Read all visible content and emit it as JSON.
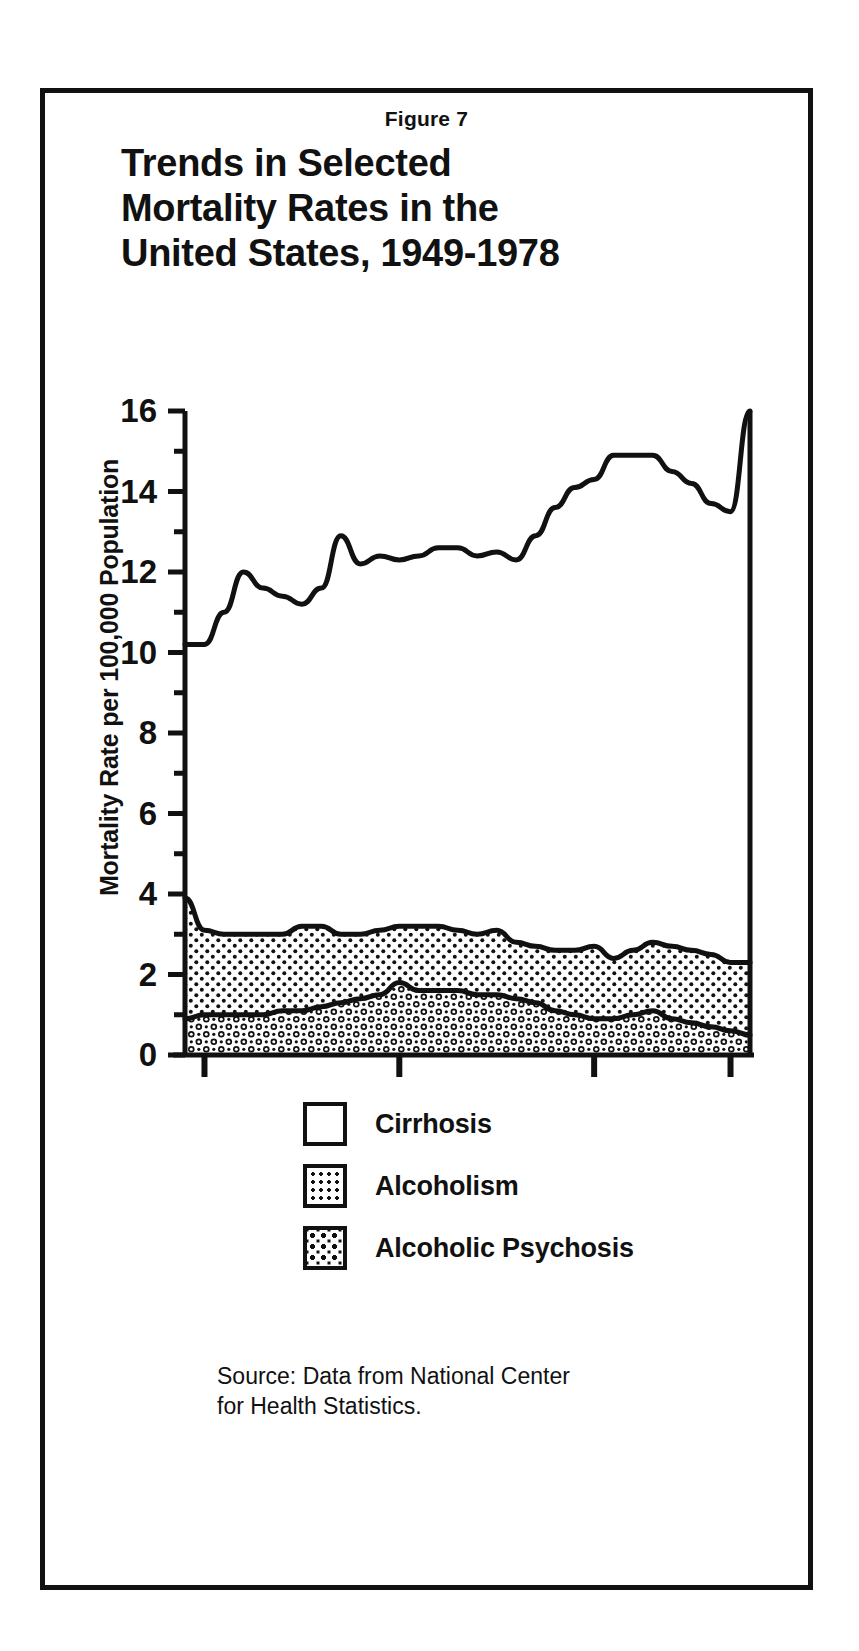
{
  "figure": {
    "number_label": "Figure 7",
    "title_line_1": "Trends in Selected",
    "title_line_2": "Mortality Rates in the",
    "title_line_3": "United States, 1949-1978"
  },
  "source": {
    "line_1": "Source: Data from National Center",
    "line_2": "for Health Statistics."
  },
  "legend": {
    "items": [
      {
        "label": "Cirrhosis",
        "pattern": "solid-white",
        "swatch_icon": "white-square-icon"
      },
      {
        "label": "Alcoholism",
        "pattern": "dots",
        "swatch_icon": "dotted-square-icon"
      },
      {
        "label": "Alcoholic Psychosis",
        "pattern": "mesh",
        "swatch_icon": "mesh-square-icon"
      }
    ]
  },
  "colors": {
    "ink": "#111111",
    "paper": "#ffffff"
  },
  "chart_data": {
    "type": "area",
    "stacked": true,
    "title": "Trends in Selected Mortality Rates in the United States, 1949-1978",
    "xlabel": "",
    "ylabel": "Mortality Rate per 100,000 Population",
    "xlim": [
      1949,
      1978
    ],
    "ylim": [
      0,
      16
    ],
    "grid": false,
    "legend_position": "below",
    "y_major_ticks": [
      0,
      2,
      4,
      6,
      8,
      10,
      12,
      14,
      16
    ],
    "y_minor_ticks": [
      1,
      3,
      5,
      7,
      9,
      11,
      13,
      15
    ],
    "y_tick_labels": [
      "0",
      "2",
      "4",
      "6",
      "8",
      "10",
      "12",
      "14",
      "16"
    ],
    "x_tick_values": [
      1950,
      1960,
      1970,
      1977
    ],
    "x_tick_labels": [
      "1950",
      "1960",
      "1970",
      "1977"
    ],
    "x": [
      1949,
      1950,
      1951,
      1952,
      1953,
      1954,
      1955,
      1956,
      1957,
      1958,
      1959,
      1960,
      1961,
      1962,
      1963,
      1964,
      1965,
      1966,
      1967,
      1968,
      1969,
      1970,
      1971,
      1972,
      1973,
      1974,
      1975,
      1976,
      1977,
      1978
    ],
    "series": [
      {
        "name": "Alcoholic Psychosis",
        "order": 1,
        "pattern": "mesh",
        "values": [
          0.9,
          1.0,
          1.0,
          1.0,
          1.0,
          1.1,
          1.1,
          1.2,
          1.3,
          1.4,
          1.5,
          1.8,
          1.6,
          1.6,
          1.6,
          1.5,
          1.5,
          1.4,
          1.3,
          1.1,
          1.0,
          0.9,
          0.9,
          1.0,
          1.1,
          0.9,
          0.8,
          0.7,
          0.6,
          0.5
        ]
      },
      {
        "name": "Alcoholism",
        "order": 2,
        "pattern": "dots",
        "values": [
          3.0,
          2.1,
          2.0,
          2.0,
          2.0,
          1.9,
          2.1,
          2.0,
          1.7,
          1.6,
          1.6,
          1.4,
          1.6,
          1.6,
          1.5,
          1.5,
          1.6,
          1.4,
          1.4,
          1.5,
          1.6,
          1.8,
          1.5,
          1.6,
          1.7,
          1.8,
          1.8,
          1.8,
          1.7,
          1.8
        ]
      },
      {
        "name": "Cirrhosis",
        "order": 3,
        "pattern": "solid-white",
        "values": [
          6.3,
          7.1,
          8.0,
          9.0,
          8.6,
          8.4,
          8.1,
          8.4,
          9.9,
          9.2,
          9.3,
          9.1,
          9.2,
          9.4,
          9.5,
          9.4,
          9.4,
          9.5,
          10.2,
          11.0,
          11.5,
          11.6,
          12.5,
          12.3,
          12.1,
          11.8,
          11.6,
          11.2,
          11.2,
          13.7
        ]
      }
    ],
    "cumulative_top_boundaries": {
      "alcoholic_psychosis_top": [
        0.9,
        1.0,
        1.0,
        1.0,
        1.0,
        1.1,
        1.1,
        1.2,
        1.3,
        1.4,
        1.5,
        1.8,
        1.6,
        1.6,
        1.6,
        1.5,
        1.5,
        1.4,
        1.3,
        1.1,
        1.0,
        0.9,
        0.9,
        1.0,
        1.1,
        0.9,
        0.8,
        0.7,
        0.6,
        0.5
      ],
      "alcoholism_top": [
        3.9,
        3.1,
        3.0,
        3.0,
        3.0,
        3.0,
        3.2,
        3.2,
        3.0,
        3.0,
        3.1,
        3.2,
        3.2,
        3.2,
        3.1,
        3.0,
        3.1,
        2.8,
        2.7,
        2.6,
        2.6,
        2.7,
        2.4,
        2.6,
        2.8,
        2.7,
        2.6,
        2.5,
        2.3,
        2.3
      ],
      "cirrhosis_top": [
        10.2,
        10.2,
        11.0,
        12.0,
        11.6,
        11.4,
        11.2,
        11.6,
        12.9,
        12.2,
        12.4,
        12.3,
        12.4,
        12.6,
        12.6,
        12.4,
        12.5,
        12.3,
        12.9,
        13.6,
        14.1,
        14.3,
        14.9,
        14.9,
        14.9,
        14.5,
        14.2,
        13.7,
        13.5,
        16.0
      ]
    }
  }
}
